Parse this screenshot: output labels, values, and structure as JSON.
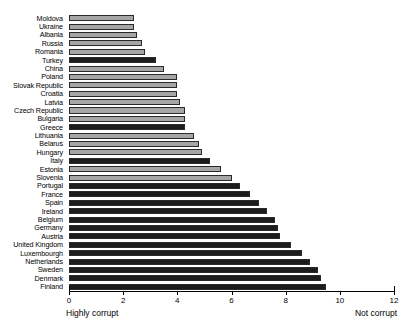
{
  "chart_data": {
    "type": "bar",
    "orientation": "horizontal",
    "title": "",
    "xlabel": "",
    "ylabel": "",
    "xlim": [
      0,
      12
    ],
    "xticks": [
      0,
      2,
      4,
      6,
      8,
      10,
      12
    ],
    "grid": false,
    "legend": null,
    "annotations": {
      "left": "Highly corrupt",
      "right": "Not corrupt"
    },
    "series_note": "Bars shaded dark mark euro-area / EMU-related members; light bars mark the others.",
    "categories": [
      "Moldova",
      "Ukraine",
      "Albania",
      "Russia",
      "Romania",
      "Turkey",
      "China",
      "Poland",
      "Slovak Republic",
      "Croatia",
      "Latvia",
      "Czech Republic",
      "Bulgaria",
      "Greece",
      "Lithuania",
      "Belarus",
      "Hungary",
      "Italy",
      "Estonia",
      "Slovenia",
      "Portugal",
      "France",
      "Spain",
      "Ireland",
      "Belgium",
      "Germany",
      "Austria",
      "United Kingdom",
      "Luxembourgh",
      "Netherlands",
      "Sweden",
      "Denmark",
      "Finland"
    ],
    "values": [
      2.4,
      2.4,
      2.5,
      2.7,
      2.8,
      3.2,
      3.5,
      4.0,
      4.0,
      4.0,
      4.1,
      4.3,
      4.3,
      4.3,
      4.6,
      4.8,
      4.9,
      5.2,
      5.6,
      6.0,
      6.3,
      6.7,
      7.0,
      7.3,
      7.6,
      7.7,
      7.8,
      8.2,
      8.6,
      8.9,
      9.2,
      9.3,
      9.5
    ],
    "bar_shades": [
      "light",
      "light",
      "light",
      "light",
      "light",
      "dark",
      "light",
      "light",
      "light",
      "light",
      "light",
      "light",
      "light",
      "dark",
      "light",
      "light",
      "light",
      "dark",
      "light",
      "light",
      "dark",
      "dark",
      "dark",
      "dark",
      "dark",
      "dark",
      "dark",
      "dark",
      "dark",
      "dark",
      "dark",
      "dark",
      "dark"
    ],
    "colors": {
      "light_bar": "#a6a6a6",
      "dark_bar": "#1c1c1c",
      "bar_outline": "#2a2a2a",
      "axis": "#000000",
      "background": "#ffffff"
    }
  }
}
